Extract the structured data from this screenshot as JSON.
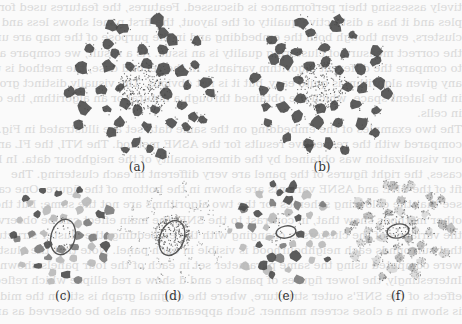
{
  "page": {
    "background": "#fafafa",
    "bleed_through_lines": [
      "tively assessing their performance is discussed. Features, the features used for sach",
      "ples and it has a distinctive quality of the layout, the first panel shows less and compact",
      "clusters, even though both the embedding and in the purpose of the map are uninformed",
      "the correct measure of clustering quality is an issue. As a result, we compare all the",
      "to compare the different algorithm variants. In the second case, the method is unbiased",
      "any given algorithm is quite easy, but it is not obvious. The visually distinct group",
      "in the latent space, which are obtained through a natural or an algorithm, the cluster",
      "in cells.",
      "The two examples of the embedding on the same data set are illustrated in Fig. 4 and",
      "compared with the respective results for the ASNE method. The NTI, the FL and the",
      "our visualization was obtained by the dimensionality of the neighbour data. In both",
      "cases, the right figures of the panel are very different in each clustering. The",
      "fit of the SNE and ASNE variants are shown in the bottom of the figure. One can",
      "see that the colouring schemes for the two algorithms are not the same; but the",
      "other methods show that, in contrast to the SNE, the main effect can be observed",
      "the variance of the clusters is changing with the embedding, the cluster structure",
      "that surrounds each neighbourhood is visible in each panel. Note that the clusters",
      "were computed using the same parameter set in each of the four panels shown here",
      "Interestingly, the lower figures of panels c and d show a red ellipse which reflects",
      "effects of the SNE's outer structure, where the original graph is still in the middle",
      "is shown in a close screen manner. Such appearance can also be observed as an effect"
    ]
  },
  "figure": {
    "panels": [
      {
        "id": "a",
        "label": "(a)",
        "cx": 143,
        "cy": 88,
        "radius": 74,
        "style": "dark",
        "label_x": 137,
        "label_y": 160,
        "core_density": 1.0,
        "ellipse": null
      },
      {
        "id": "b",
        "label": "(b)",
        "cx": 322,
        "cy": 86,
        "radius": 72,
        "style": "dark",
        "label_x": 322,
        "label_y": 160,
        "core_density": 0.8,
        "ellipse": null
      },
      {
        "id": "c",
        "label": "(c)",
        "cx": 62,
        "cy": 233,
        "radius": 52,
        "style": "mixed",
        "label_x": 63,
        "label_y": 289,
        "core_density": 0.15,
        "ellipse": {
          "cx": 63,
          "cy": 237,
          "rx": 12,
          "ry": 18,
          "rot": 15
        }
      },
      {
        "id": "d",
        "label": "(d)",
        "cx": 172,
        "cy": 233,
        "radius": 52,
        "style": "sparse",
        "label_x": 173,
        "label_y": 289,
        "core_density": 0.9,
        "ellipse": {
          "cx": 172,
          "cy": 238,
          "rx": 12,
          "ry": 18,
          "rot": 20
        }
      },
      {
        "id": "e",
        "label": "(e)",
        "cx": 284,
        "cy": 230,
        "radius": 52,
        "style": "mixed",
        "label_x": 286,
        "label_y": 289,
        "core_density": 0.1,
        "ellipse": {
          "cx": 286,
          "cy": 232,
          "rx": 10,
          "ry": 6,
          "rot": -10
        }
      },
      {
        "id": "f",
        "label": "(f)",
        "cx": 397,
        "cy": 228,
        "radius": 52,
        "style": "speckle",
        "label_x": 398,
        "label_y": 289,
        "core_density": 0.3,
        "ellipse": {
          "cx": 398,
          "cy": 231,
          "rx": 11,
          "ry": 7,
          "rot": -10
        }
      }
    ],
    "colors": {
      "dark": "#4a4a4a",
      "mid": "#7a7a7a",
      "light": "#b8b8b8",
      "ellipse": "#555555",
      "label": "#333333"
    }
  }
}
